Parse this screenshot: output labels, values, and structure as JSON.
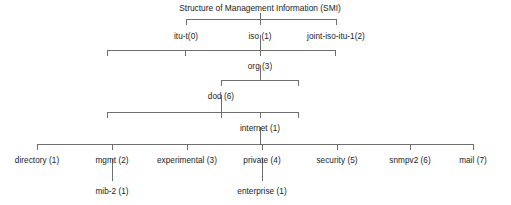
{
  "diagram": {
    "title": "Structure of Management Information (SMI)",
    "type": "tree",
    "line_color": "#6e6e6e",
    "text_color": "#1a1a1a",
    "background": "#ffffff",
    "levels": [
      {
        "name": "root-children",
        "nodes": [
          {
            "label": "itu-t(0)",
            "x": 186,
            "y": 32
          },
          {
            "label": "iso (1)",
            "x": 260,
            "y": 32
          },
          {
            "label": "joint-iso-itu-1(2)",
            "x": 336,
            "y": 32
          }
        ]
      },
      {
        "name": "iso-children",
        "nodes": [
          {
            "label": "org (3)",
            "x": 260,
            "y": 62
          }
        ]
      },
      {
        "name": "org-children",
        "nodes": [
          {
            "label": "dod (6)",
            "x": 221,
            "y": 92
          }
        ]
      },
      {
        "name": "dod-children",
        "nodes": [
          {
            "label": "internet (1)",
            "x": 260,
            "y": 124
          }
        ]
      },
      {
        "name": "internet-children",
        "nodes": [
          {
            "label": "directory (1)",
            "x": 37,
            "y": 156
          },
          {
            "label": "mgmt (2)",
            "x": 112,
            "y": 156
          },
          {
            "label": "experimental (3)",
            "x": 187,
            "y": 156
          },
          {
            "label": "private (4)",
            "x": 262,
            "y": 156
          },
          {
            "label": "security (5)",
            "x": 337,
            "y": 156
          },
          {
            "label": "snmpv2 (6)",
            "x": 410,
            "y": 156
          },
          {
            "label": "mail (7)",
            "x": 473,
            "y": 156
          }
        ]
      },
      {
        "name": "leaf-children",
        "nodes": [
          {
            "label": "mib-2 (1)",
            "x": 112,
            "y": 187
          },
          {
            "label": "enterprise (1)",
            "x": 262,
            "y": 187
          }
        ]
      }
    ]
  }
}
